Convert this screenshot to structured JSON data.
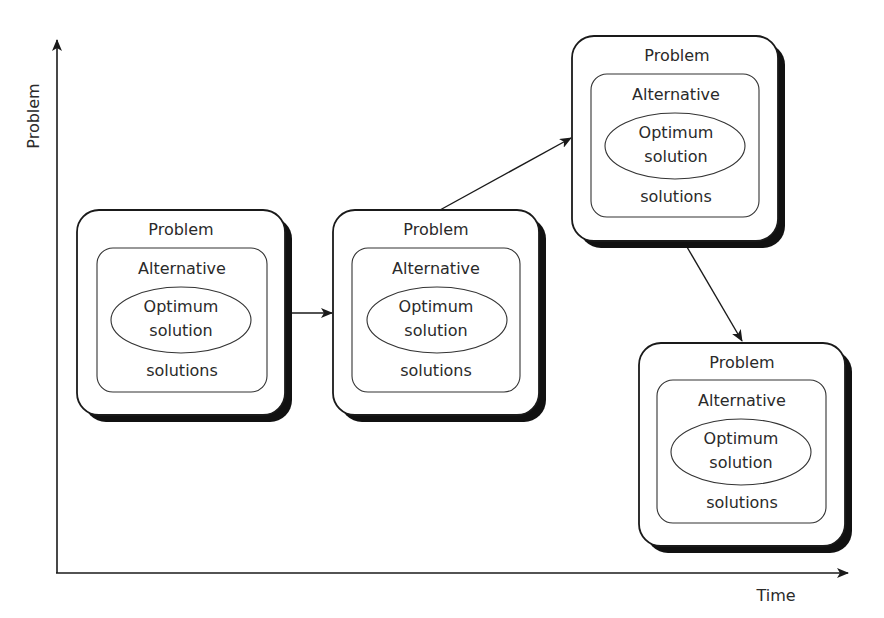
{
  "axes": {
    "y_label": "Problem",
    "x_label": "Time"
  },
  "boxes": [
    {
      "outer_label": "Problem",
      "inner_label_top": "Alternative",
      "inner_label_bottom": "solutions",
      "core_line1": "Optimum",
      "core_line2": "solution"
    },
    {
      "outer_label": "Problem",
      "inner_label_top": "Alternative",
      "inner_label_bottom": "solutions",
      "core_line1": "Optimum",
      "core_line2": "solution"
    },
    {
      "outer_label": "Problem",
      "inner_label_top": "Alternative",
      "inner_label_bottom": "solutions",
      "core_line1": "Optimum",
      "core_line2": "solution"
    },
    {
      "outer_label": "Problem",
      "inner_label_top": "Alternative",
      "inner_label_bottom": "solutions",
      "core_line1": "Optimum",
      "core_line2": "solution"
    }
  ],
  "connections": [
    {
      "from": 0,
      "to": 1
    },
    {
      "from": 1,
      "to": 2
    },
    {
      "from": 2,
      "to": 3
    }
  ],
  "colors": {
    "stroke": "#1a1a1a",
    "text": "#2a2a2a",
    "shadow": "#111111"
  }
}
